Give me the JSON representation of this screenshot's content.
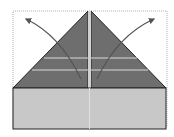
{
  "diagram": {
    "type": "origami-fold-step",
    "colors": {
      "background": "#ffffff",
      "dotted_outline": "#b0b0b0",
      "flap_fill": "#6e6e6e",
      "base_fill": "#c8c8c8",
      "edge": "#222222",
      "crease": "#d8d8d8",
      "arrow": "#555555"
    },
    "elements": [
      {
        "name": "dotted-outline",
        "desc": "previous paper position (dotted)"
      },
      {
        "name": "left-flap",
        "desc": "left triangular flap, dark"
      },
      {
        "name": "right-flap",
        "desc": "right triangular flap, dark"
      },
      {
        "name": "base-rectangle",
        "desc": "light grey bottom band"
      },
      {
        "name": "left-arrow",
        "desc": "curved arrow unfolding left flap outward"
      },
      {
        "name": "right-arrow",
        "desc": "curved arrow unfolding right flap outward"
      }
    ]
  }
}
